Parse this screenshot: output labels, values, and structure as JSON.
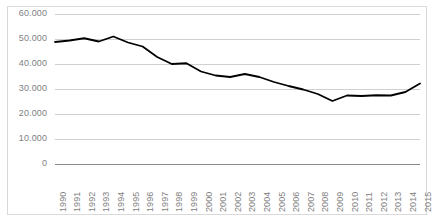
{
  "chart_data": {
    "type": "line",
    "title": "",
    "subtitle": "",
    "xlabel": "",
    "ylabel": "",
    "categories": [
      "1990",
      "1991",
      "1992",
      "1993",
      "1994",
      "1995",
      "1996",
      "1997",
      "1998",
      "1999",
      "2000",
      "2001",
      "2002",
      "2003",
      "2004",
      "2005",
      "2006",
      "2007",
      "2008",
      "2009",
      "2010",
      "2011",
      "2012",
      "2013",
      "2014",
      "2015"
    ],
    "values": [
      48800,
      49400,
      50300,
      49000,
      51000,
      48600,
      47000,
      42800,
      40000,
      40300,
      37000,
      35400,
      34800,
      36000,
      34800,
      32800,
      31200,
      29800,
      28000,
      25200,
      27400,
      27200,
      27500,
      27400,
      28800,
      32200
    ],
    "series": [
      {
        "name": "",
        "values": [
          48800,
          49400,
          50300,
          49000,
          51000,
          48600,
          47000,
          42800,
          40000,
          40300,
          37000,
          35400,
          34800,
          36000,
          34800,
          32800,
          31200,
          29800,
          28000,
          25200,
          27400,
          27200,
          27500,
          27400,
          28800,
          32200
        ]
      }
    ],
    "ylim": [
      0,
      60000
    ],
    "y_ticks": [
      0,
      10000,
      20000,
      30000,
      40000,
      50000,
      60000
    ],
    "y_tick_labels": [
      "0",
      "10.000",
      "20.000",
      "30.000",
      "40.000",
      "50.000",
      "60.000"
    ],
    "grid": true,
    "legend": false,
    "legend_position": "none",
    "line_color": "#000000",
    "grid_color": "#d0d0d0",
    "axis_color": "#8a8a8a",
    "tick_label_color": "#808080",
    "x_tick_rotation": -90
  }
}
